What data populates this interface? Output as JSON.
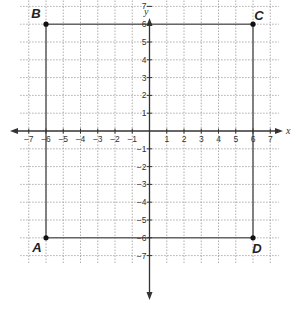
{
  "chart_data": {
    "type": "scatter",
    "title": "",
    "xlabel": "x",
    "ylabel": "y",
    "xlim": [
      -7,
      7
    ],
    "ylim": [
      -7,
      7
    ],
    "grid": true,
    "x_ticks": [
      "-7",
      "-6",
      "-5",
      "-4",
      "-3",
      "-2",
      "-1",
      "1",
      "2",
      "3",
      "4",
      "5",
      "6",
      "7"
    ],
    "y_ticks": [
      "7",
      "6",
      "5",
      "4",
      "3",
      "2",
      "1",
      "-1",
      "-2",
      "-3",
      "-4",
      "-5",
      "-6",
      "-7"
    ],
    "points": [
      {
        "label": "A",
        "x": -6,
        "y": -6
      },
      {
        "label": "B",
        "x": -6,
        "y": 6
      },
      {
        "label": "C",
        "x": 6,
        "y": 6
      },
      {
        "label": "D",
        "x": 6,
        "y": -6
      }
    ],
    "segments": [
      [
        "A",
        "B"
      ],
      [
        "B",
        "C"
      ],
      [
        "C",
        "D"
      ],
      [
        "D",
        "A"
      ]
    ]
  },
  "axes": {
    "x_name": "x",
    "y_name": "y"
  },
  "colors": {
    "grid": "#999999",
    "axis": "#333333",
    "segment": "#666666",
    "point": "#111111"
  }
}
